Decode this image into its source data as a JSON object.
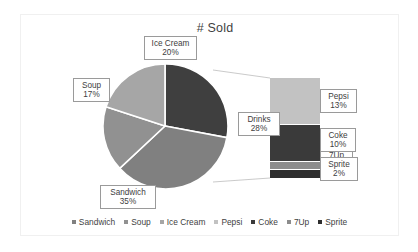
{
  "chart_data": {
    "type": "pie",
    "variant": "bar-of-pie",
    "title": "# Sold",
    "xlabel": "",
    "ylabel": "",
    "grid": false,
    "legend_position": "bottom",
    "categories": [
      "Sandwich",
      "Soup",
      "Ice Cream",
      "Pepsi",
      "Coke",
      "7Up",
      "Sprite"
    ],
    "values": [
      35,
      17,
      20,
      13,
      10,
      3,
      2
    ],
    "unit": "%",
    "pie": {
      "slices": [
        {
          "label": "Sandwich",
          "value": 35,
          "display": "35%",
          "color": "#808080"
        },
        {
          "label": "Soup",
          "value": 17,
          "display": "17%",
          "color": "#919191"
        },
        {
          "label": "Ice Cream",
          "value": 20,
          "display": "20%",
          "color": "#a6a6a6"
        },
        {
          "label": "Drinks",
          "value": 28,
          "display": "28%",
          "color": "#3f3f3f"
        }
      ]
    },
    "bar": {
      "title": "Drinks breakdown",
      "segments": [
        {
          "label": "Pepsi",
          "value": 13,
          "display": "13%",
          "color": "#c2c2c2"
        },
        {
          "label": "Coke",
          "value": 10,
          "display": "10%",
          "color": "#3a3a3a"
        },
        {
          "label": "7Up",
          "value": 3,
          "display": "3%",
          "color": "#8c8c8c"
        },
        {
          "label": "Sprite",
          "value": 2,
          "display": "2%",
          "color": "#2e2e2e"
        }
      ]
    },
    "callouts": [
      {
        "name": "Ice Cream",
        "value": "20%"
      },
      {
        "name": "Soup",
        "value": "17%"
      },
      {
        "name": "Sandwich",
        "value": "35%"
      },
      {
        "name": "Drinks",
        "value": "28%"
      },
      {
        "name": "Pepsi",
        "value": "13%"
      },
      {
        "name": "Coke",
        "value": "10%"
      },
      {
        "name": "7Up",
        "value": ""
      },
      {
        "name": "Sprite",
        "value": "2%"
      }
    ],
    "legend": [
      {
        "label": "Sandwich",
        "color": "#808080"
      },
      {
        "label": "Soup",
        "color": "#919191"
      },
      {
        "label": "Ice Cream",
        "color": "#a6a6a6"
      },
      {
        "label": "Pepsi",
        "color": "#c2c2c2"
      },
      {
        "label": "Coke",
        "color": "#3a3a3a"
      },
      {
        "label": "7Up",
        "color": "#8c8c8c"
      },
      {
        "label": "Sprite",
        "color": "#2e2e2e"
      }
    ]
  },
  "callouts": {
    "ice_cream": {
      "name": "Ice Cream",
      "value": "20%"
    },
    "soup": {
      "name": "Soup",
      "value": "17%"
    },
    "sandwich": {
      "name": "Sandwich",
      "value": "35%"
    },
    "drinks": {
      "name": "Drinks",
      "value": "28%"
    },
    "pepsi": {
      "name": "Pepsi",
      "value": "13%"
    },
    "coke": {
      "name": "Coke",
      "value": "10%"
    },
    "sevenup": {
      "name": "7Up",
      "value": ""
    },
    "sprite": {
      "name": "Sprite",
      "value": "2%"
    }
  },
  "header": {
    "title": "# Sold"
  }
}
